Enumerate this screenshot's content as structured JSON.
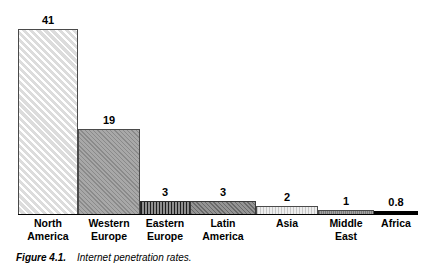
{
  "figure": {
    "caption_number": "Figure 4.1.",
    "caption_text": "Internet penetration rates."
  },
  "chart_data": {
    "type": "bar",
    "title": "Internet penetration rates",
    "xlabel": "",
    "ylabel": "",
    "ylim": [
      0,
      44
    ],
    "grid": false,
    "legend": "none",
    "orientation": "vertical",
    "categories": [
      "North America",
      "Western Europe",
      "Eastern Europe",
      "Latin America",
      "Asia",
      "Middle East",
      "Africa"
    ],
    "category_lines": [
      [
        "North",
        "America"
      ],
      [
        "Western",
        "Europe"
      ],
      [
        "Eastern",
        "Europe"
      ],
      [
        "Latin",
        "America"
      ],
      [
        "Asia",
        ""
      ],
      [
        "Middle",
        "East"
      ],
      [
        "Africa",
        ""
      ]
    ],
    "values": [
      41,
      19,
      3,
      3,
      2,
      1,
      0.8
    ],
    "value_labels": [
      "41",
      "19",
      "3",
      "3",
      "2",
      "1",
      "0.8"
    ],
    "bar_fills": [
      "light-grey-diagonal-hatch",
      "mid-grey-diagonal-hatch",
      "dark-vertical-hatch",
      "dark-grey-diagonal-hatch",
      "light-grey-vertical-hatch",
      "mid-grey-solid",
      "solid-black"
    ]
  },
  "colors": {
    "axis": "#000000",
    "text": "#000000",
    "background": "#ffffff"
  }
}
